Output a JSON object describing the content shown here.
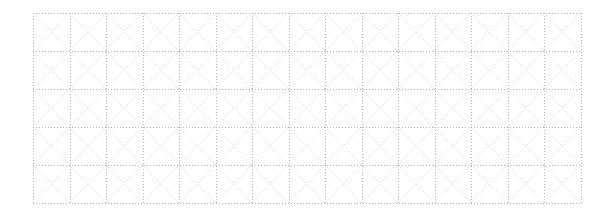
{
  "canvas": {
    "width": 613,
    "height": 216,
    "background": "#ffffff"
  },
  "grid": {
    "left": 33,
    "top": 13,
    "cols": 15,
    "rows": 5,
    "cell_width": 36.5,
    "cell_height": 38,
    "line_color": "#b8b8b8",
    "diagonal_color": "#cfcfcf",
    "line_style": "dotted",
    "diagonals": true
  }
}
